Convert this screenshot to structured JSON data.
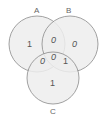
{
  "diagram": {
    "type": "venn",
    "sets": [
      {
        "label": "A",
        "region_only": "1"
      },
      {
        "label": "B",
        "region_only": "0"
      },
      {
        "label": "C",
        "region_only": "1"
      }
    ],
    "labels": {
      "a": "A",
      "b": "B",
      "c": "C"
    },
    "regions": {
      "a_only": "1",
      "b_only": "0",
      "c_only": "1",
      "ab_only": "0",
      "ac_only": "0",
      "bc_only": "1",
      "abc": "0"
    },
    "colors": {
      "fill": "#ececec",
      "stroke": "#8a8a8a",
      "text": "#555555"
    }
  }
}
